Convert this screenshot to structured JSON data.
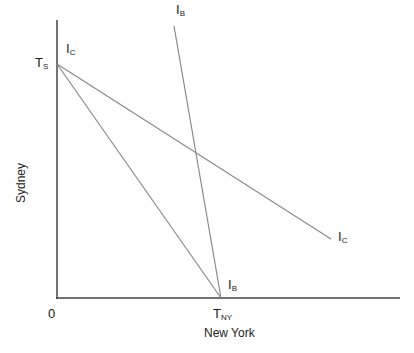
{
  "diagram": {
    "axes": {
      "x_label": "New York",
      "y_label": "Sydney",
      "origin_label": "0"
    },
    "points": {
      "ts": {
        "main": "T",
        "sub": "S"
      },
      "tny": {
        "main": "T",
        "sub": "NY"
      }
    },
    "lines": {
      "ib_top": {
        "main": "I",
        "sub": "B"
      },
      "ib_bottom": {
        "main": "I",
        "sub": "B"
      },
      "ic_top": {
        "main": "I",
        "sub": "C"
      },
      "ic_right": {
        "main": "I",
        "sub": "C"
      }
    },
    "colors": {
      "axis": "#444444",
      "line": "#8a8a8a",
      "text": "#222222"
    }
  }
}
